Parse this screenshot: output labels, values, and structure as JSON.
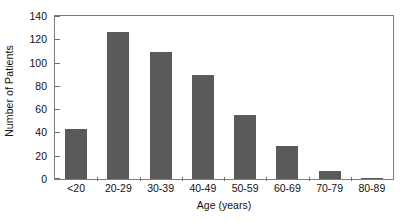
{
  "chart_data": {
    "type": "bar",
    "title": "",
    "subtitle": "",
    "xlabel": "Age (years)",
    "ylabel": "Number of Patients",
    "categories": [
      "<20",
      "20-29",
      "30-39",
      "40-49",
      "50-59",
      "60-69",
      "70-79",
      "80-89"
    ],
    "values": [
      43,
      126,
      109,
      89,
      55,
      28,
      7,
      1
    ],
    "ylim": [
      0,
      140
    ],
    "yticks": [
      0,
      20,
      40,
      60,
      80,
      100,
      120,
      140
    ],
    "ytick_labels": [
      "0",
      "20",
      "40",
      "60",
      "80",
      "100",
      "120",
      "140"
    ],
    "grid": false,
    "legend": null,
    "legend_position": "none",
    "bar_color": "#5a5a5a",
    "axis_color": "#7d7d7d",
    "background_color": "#ffffff",
    "annotations": []
  }
}
